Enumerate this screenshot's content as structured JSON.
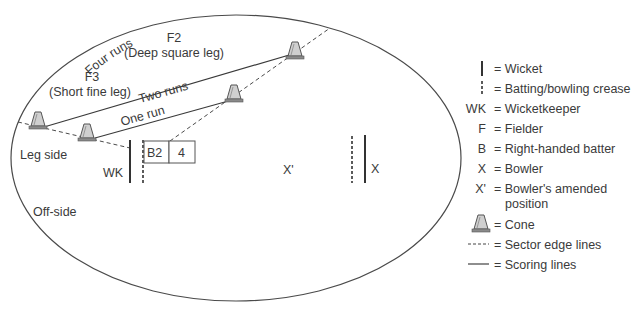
{
  "diagram": {
    "field": {
      "boundary_label": "Four runs",
      "side_labels": {
        "leg": "Leg side",
        "off": "Off-side"
      }
    },
    "fielders": [
      {
        "id": "F2",
        "name": "(Deep square leg)"
      },
      {
        "id": "F3",
        "name": "(Short fine leg)"
      }
    ],
    "scoring_lines": [
      {
        "label": "Two runs"
      },
      {
        "label": "One run"
      }
    ],
    "players": {
      "wicketkeeper": "WK",
      "batter": "B2",
      "batter_box_value": "4",
      "bowler": "X",
      "bowler_amended": "X'"
    },
    "colors": {
      "line": "#3a3a3a",
      "cone_fill": "#c8c8c8",
      "cone_base": "#7a7a7a"
    }
  },
  "legend": {
    "items": [
      {
        "symbol": "wicket-line",
        "symbol_text": "",
        "label": "= Wicket"
      },
      {
        "symbol": "crease-dashed",
        "symbol_text": "",
        "label": "= Batting/bowling crease"
      },
      {
        "symbol": "text",
        "symbol_text": "WK",
        "label": "= Wicketkeeper"
      },
      {
        "symbol": "text",
        "symbol_text": "F",
        "label": "= Fielder"
      },
      {
        "symbol": "text",
        "symbol_text": "B",
        "label": "= Right-handed batter"
      },
      {
        "symbol": "text",
        "symbol_text": "X",
        "label": "= Bowler"
      },
      {
        "symbol": "text",
        "symbol_text": "X'",
        "label": "= Bowler's amended",
        "label2": "position"
      },
      {
        "symbol": "cone",
        "symbol_text": "",
        "label": "= Cone"
      },
      {
        "symbol": "dashed-line",
        "symbol_text": "----",
        "label": "= Sector edge lines"
      },
      {
        "symbol": "solid-line",
        "symbol_text": "",
        "label": "= Scoring lines"
      }
    ]
  }
}
